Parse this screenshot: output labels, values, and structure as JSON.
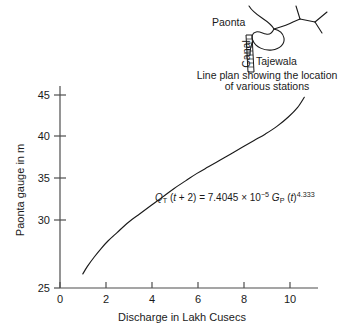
{
  "chart_data": {
    "type": "line",
    "title": "",
    "xlabel": "Discharge in Lakh Cusecs",
    "ylabel": "Paonta gauge in m",
    "xlim": [
      0,
      11.3
    ],
    "ylim": [
      25,
      46.5
    ],
    "xticks": [
      0,
      2,
      4,
      6,
      8,
      10
    ],
    "xtick_labels": [
      "0",
      "2",
      "4",
      "6",
      "8",
      "10"
    ],
    "yticks": [
      25,
      30,
      35,
      40,
      45
    ],
    "ytick_labels": [
      "25",
      "30",
      "35",
      "40",
      "45"
    ],
    "grid": false,
    "legend": "none",
    "series": [
      {
        "name": "Paonta gauge rating curve",
        "x": [
          1.0,
          1.2,
          1.5,
          1.8,
          2.1,
          2.5,
          3.0,
          3.5,
          4.0,
          4.5,
          5.0,
          5.5,
          6.0,
          6.5,
          7.0,
          7.5,
          8.0,
          8.5,
          9.0,
          9.5,
          10.0,
          10.4,
          10.7
        ],
        "y": [
          26.5,
          27.3,
          28.3,
          29.2,
          30.0,
          30.9,
          32.0,
          32.9,
          33.8,
          34.7,
          35.6,
          36.4,
          37.2,
          37.9,
          38.6,
          39.3,
          40.0,
          40.7,
          41.4,
          42.2,
          43.2,
          44.2,
          45.3
        ]
      }
    ],
    "annotations": [
      {
        "name": "rating-equation",
        "text": "QT (t + 2) = 7.4045 × 10−5 GP (t)4.333",
        "parts": {
          "q": "Q",
          "q_sub": "T",
          "lhs_rest": " (",
          "t1": "t",
          "plus2": " + 2) = 7.4045 ",
          "times": "×",
          "ten": " 10",
          "exp1": "−5",
          "g": " G",
          "g_sub": "P",
          "open": " (",
          "t2": "t",
          "close": ")",
          "exp2": "4.333"
        },
        "x": 4.1,
        "y": 34.0
      }
    ]
  },
  "inset": {
    "name": "line-plan-inset",
    "labels": {
      "station_upstream": "Paonta",
      "station_downstream": "Tajewala",
      "canal": "Canal"
    },
    "caption_line1": "Line plan showing the location",
    "caption_line2": "of various stations"
  },
  "colors": {
    "curve": "#1a1a1a",
    "axis": "#4d4d4d",
    "text": "#1a1a1a",
    "background": "#ffffff"
  }
}
